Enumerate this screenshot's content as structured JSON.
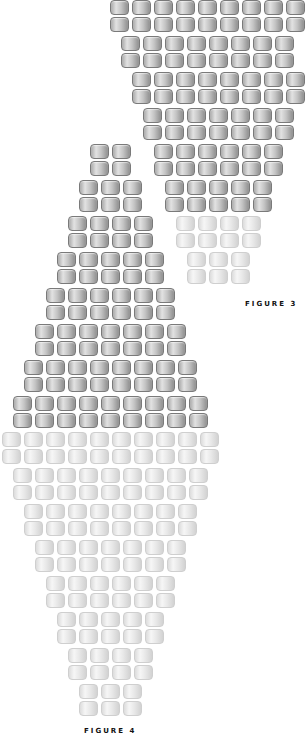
{
  "figures": [
    {
      "id": "figure-3",
      "label": "FIGURE 3",
      "label_pos": {
        "x": 245,
        "y": 300
      },
      "bead_pitch_x": 22,
      "row_pitch_y": 18,
      "pairs": [
        {
          "x": 110,
          "y": 0,
          "count": 9,
          "tone": "dark"
        },
        {
          "x": 121,
          "y": 36,
          "count": 8,
          "tone": "dark"
        },
        {
          "x": 132,
          "y": 72,
          "count": 8,
          "tone": "dark"
        },
        {
          "x": 143,
          "y": 108,
          "count": 7,
          "tone": "dark"
        },
        {
          "x": 154,
          "y": 144,
          "count": 6,
          "tone": "dark"
        },
        {
          "x": 165,
          "y": 180,
          "count": 5,
          "tone": "dark"
        },
        {
          "x": 176,
          "y": 216,
          "count": 4,
          "tone": "light"
        },
        {
          "x": 187,
          "y": 252,
          "count": 3,
          "tone": "light"
        }
      ]
    },
    {
      "id": "figure-4",
      "label": "FIGURE 4",
      "label_pos": {
        "x": 84,
        "y": 727
      },
      "bead_pitch_x": 22,
      "row_pitch_y": 18,
      "pairs": [
        {
          "x": 90,
          "y": 144,
          "count": 2,
          "tone": "dark"
        },
        {
          "x": 79,
          "y": 180,
          "count": 3,
          "tone": "dark"
        },
        {
          "x": 68,
          "y": 216,
          "count": 4,
          "tone": "dark"
        },
        {
          "x": 57,
          "y": 252,
          "count": 5,
          "tone": "dark"
        },
        {
          "x": 46,
          "y": 288,
          "count": 6,
          "tone": "dark"
        },
        {
          "x": 35,
          "y": 324,
          "count": 7,
          "tone": "dark"
        },
        {
          "x": 24,
          "y": 360,
          "count": 8,
          "tone": "dark"
        },
        {
          "x": 13,
          "y": 396,
          "count": 9,
          "tone": "dark"
        },
        {
          "x": 2,
          "y": 432,
          "count": 10,
          "tone": "light"
        },
        {
          "x": 13,
          "y": 468,
          "count": 9,
          "tone": "light"
        },
        {
          "x": 24,
          "y": 504,
          "count": 8,
          "tone": "light"
        },
        {
          "x": 35,
          "y": 540,
          "count": 7,
          "tone": "light"
        },
        {
          "x": 46,
          "y": 576,
          "count": 6,
          "tone": "light"
        },
        {
          "x": 57,
          "y": 612,
          "count": 5,
          "tone": "light"
        },
        {
          "x": 68,
          "y": 648,
          "count": 4,
          "tone": "light"
        },
        {
          "x": 79,
          "y": 684,
          "count": 3,
          "tone": "light"
        }
      ]
    }
  ],
  "colors": {
    "dark_bead_outline": "#7a7a7a",
    "dark_bead_highlight": "#e2e2e2",
    "dark_bead_shadow": "#8e8e8e",
    "light_bead_outline": "#cfcfcf",
    "light_bead_fill": "#f0f0f0",
    "label_text": "#111111",
    "background": "#ffffff"
  }
}
